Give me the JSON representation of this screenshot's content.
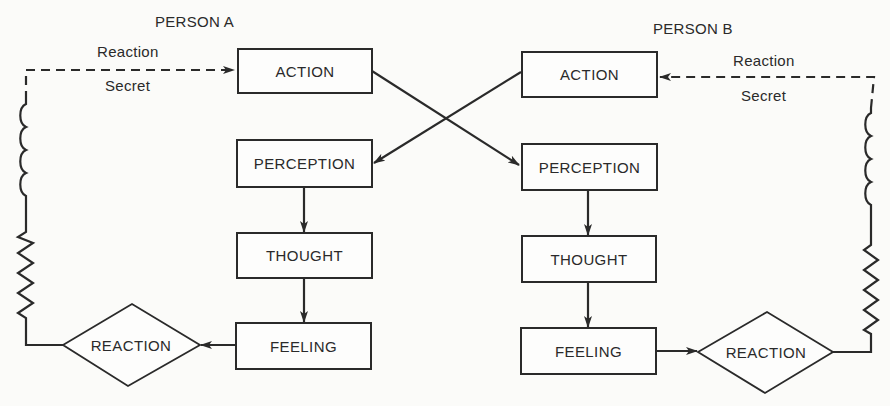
{
  "diagram": {
    "person_a": {
      "title": "PERSON A",
      "feedback_label_top": "Reaction",
      "feedback_label_bottom": "Secret",
      "action": "ACTION",
      "perception": "PERCEPTION",
      "thought": "THOUGHT",
      "feeling": "FEELING",
      "reaction": "REACTION"
    },
    "person_b": {
      "title": "PERSON B",
      "feedback_label_top": "Reaction",
      "feedback_label_bottom": "Secret",
      "action": "ACTION",
      "perception": "PERCEPTION",
      "thought": "THOUGHT",
      "feeling": "FEELING",
      "reaction": "REACTION"
    },
    "colors": {
      "ink": "#2a2a2a",
      "background": "#fbfbf9"
    }
  }
}
